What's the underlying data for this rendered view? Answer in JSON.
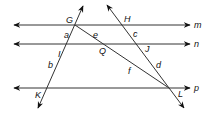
{
  "diagram": {
    "colors": {
      "stroke": "#333333",
      "text": "#111111",
      "background": "#ffffff"
    },
    "parallel_lines": [
      {
        "name": "m",
        "label": "m",
        "y": 25
      },
      {
        "name": "n",
        "label": "n",
        "y": 44
      },
      {
        "name": "p",
        "label": "p",
        "y": 88
      }
    ],
    "transversals": [
      {
        "name": "line-GK",
        "through": [
          "G",
          "I",
          "K"
        ]
      },
      {
        "name": "line-HL",
        "through": [
          "H",
          "J",
          "L"
        ]
      },
      {
        "name": "segment-GL",
        "through": [
          "G",
          "Q",
          "L"
        ]
      }
    ],
    "points": {
      "G": "G",
      "H": "H",
      "I": "I",
      "J": "J",
      "K": "K",
      "L": "L",
      "Q": "Q"
    },
    "angles": {
      "a": "a",
      "b": "b",
      "c": "c",
      "d": "d",
      "e": "e",
      "f": "f"
    }
  }
}
